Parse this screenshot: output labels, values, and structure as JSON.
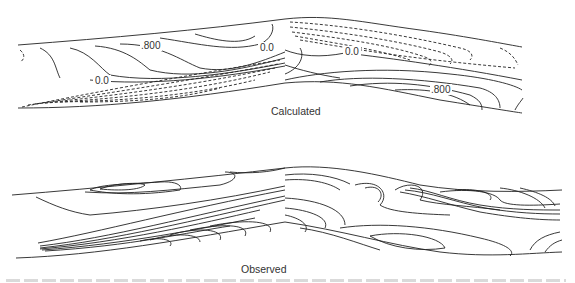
{
  "figure": {
    "panels": [
      {
        "id": "calculated",
        "caption": "Calculated",
        "contour_labels": [
          ".800",
          "0.0",
          "0.0",
          "0.0",
          ".800"
        ],
        "line_styles": {
          "positive": "solid",
          "negative": "dashed"
        }
      },
      {
        "id": "observed",
        "caption": "Observed",
        "contour_labels": []
      }
    ],
    "colors": {
      "line": "#222222",
      "background": "#ffffff"
    }
  }
}
